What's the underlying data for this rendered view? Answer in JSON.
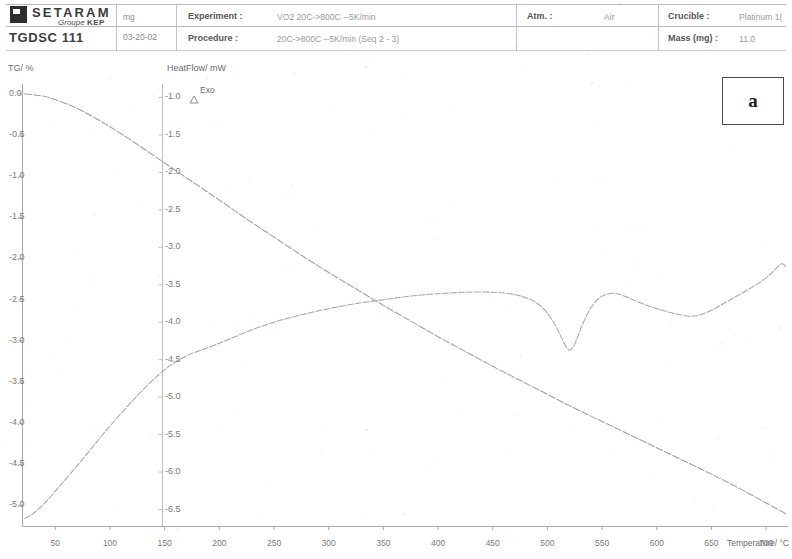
{
  "header": {
    "logo_word": "SETARAM",
    "logo_sub_italic": "Groupe",
    "logo_sub_bold": "KEP",
    "instrument": "TGDSC 111",
    "sample_mass_unit": "mg",
    "sample_date": "03-20-02",
    "fields": {
      "experiment_key": "Experiment :",
      "experiment_val": "VO2 20C->800C --5K/min",
      "procedure_key": "Procedure :",
      "procedure_val": "20C->800C --5K/min (Seq 2 - 3)",
      "atm_key": "Atm. :",
      "atm_val": "Air",
      "crucible_key": "Crucible :",
      "crucible_val": "Platinum 1(",
      "mass_key": "Mass (mg) :",
      "mass_val": "11.0"
    }
  },
  "panel": {
    "letter": "a"
  },
  "chart_data": {
    "type": "line",
    "title": "",
    "xlabel": "Temperature/ °C",
    "ylabel": "TG/ %",
    "y2label": "HeatFlow/ mW",
    "exo_marker": "Exo",
    "grid": false,
    "xlim": [
      20,
      720
    ],
    "xticks": [
      50,
      100,
      150,
      200,
      250,
      300,
      350,
      400,
      450,
      500,
      550,
      600,
      650,
      700
    ],
    "ylim": [
      -5.25,
      0.12
    ],
    "yticks": [
      0.0,
      -0.5,
      -1.0,
      -1.5,
      -2.0,
      -2.5,
      -3.0,
      -3.5,
      -4.0,
      -4.5,
      -5.0
    ],
    "ytick_labels": [
      "0.0",
      "-0.5",
      "-1.0",
      "-1.5",
      "-2.0",
      "-2.5",
      "-3.0",
      "-3.5",
      "-4.0",
      "-4.5",
      "-5.0"
    ],
    "y2lim": [
      -6.72,
      -0.82
    ],
    "y2ticks": [
      -1.0,
      -1.5,
      -2.0,
      -2.5,
      -3.0,
      -3.5,
      -4.0,
      -4.5,
      -5.0,
      -5.5,
      -6.0,
      -6.5
    ],
    "y2tick_labels": [
      "-1.0",
      "-1.5",
      "-2.0",
      "-2.5",
      "-3.0",
      "-3.5",
      "-4.0",
      "-4.5",
      "-5.0",
      "-5.5",
      "-6.0",
      "-6.5"
    ],
    "series": [
      {
        "name": "TG",
        "axis": "left",
        "unit": "%",
        "x": [
          22,
          30,
          40,
          50,
          62,
          75,
          90,
          105,
          120,
          140,
          160,
          180,
          200,
          225,
          250,
          275,
          300,
          325,
          350,
          375,
          400,
          425,
          450,
          475,
          500,
          525,
          550,
          575,
          600,
          625,
          650,
          675,
          700,
          718
        ],
        "y": [
          0.0,
          -0.01,
          -0.03,
          -0.07,
          -0.13,
          -0.21,
          -0.32,
          -0.44,
          -0.57,
          -0.75,
          -0.93,
          -1.11,
          -1.29,
          -1.52,
          -1.74,
          -1.96,
          -2.17,
          -2.37,
          -2.57,
          -2.76,
          -2.95,
          -3.13,
          -3.31,
          -3.48,
          -3.65,
          -3.82,
          -3.98,
          -4.14,
          -4.3,
          -4.46,
          -4.62,
          -4.79,
          -4.97,
          -5.1
        ]
      },
      {
        "name": "HeatFlow",
        "axis": "right",
        "unit": "mW",
        "x": [
          22,
          30,
          40,
          52,
          65,
          80,
          95,
          110,
          125,
          140,
          155,
          170,
          182,
          195,
          210,
          230,
          250,
          270,
          290,
          310,
          330,
          350,
          375,
          400,
          425,
          450,
          470,
          485,
          495,
          502,
          508,
          512,
          516,
          520,
          524,
          528,
          533,
          540,
          548,
          556,
          564,
          572,
          580,
          592,
          605,
          618,
          630,
          640,
          650,
          660,
          672,
          684,
          696,
          706,
          714,
          718
        ],
        "y": [
          -6.62,
          -6.55,
          -6.42,
          -6.22,
          -6.0,
          -5.74,
          -5.47,
          -5.22,
          -4.98,
          -4.76,
          -4.58,
          -4.45,
          -4.38,
          -4.31,
          -4.22,
          -4.1,
          -4.0,
          -3.92,
          -3.85,
          -3.79,
          -3.74,
          -3.7,
          -3.65,
          -3.62,
          -3.6,
          -3.6,
          -3.63,
          -3.7,
          -3.8,
          -3.92,
          -4.06,
          -4.18,
          -4.3,
          -4.37,
          -4.32,
          -4.18,
          -4.0,
          -3.8,
          -3.67,
          -3.62,
          -3.62,
          -3.66,
          -3.71,
          -3.78,
          -3.84,
          -3.89,
          -3.92,
          -3.9,
          -3.84,
          -3.76,
          -3.66,
          -3.56,
          -3.45,
          -3.33,
          -3.22,
          -3.26
        ]
      }
    ],
    "annotations": [
      {
        "text": "a",
        "type": "panel-label"
      }
    ]
  }
}
